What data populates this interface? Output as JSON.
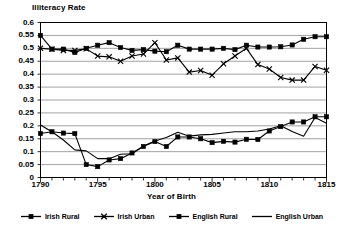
{
  "chart_data": {
    "type": "line",
    "title": "Illiteracy Rate",
    "xlabel": "Year of Birth",
    "ylabel": "",
    "xlim": [
      1790,
      1815
    ],
    "ylim": [
      0,
      0.6
    ],
    "grid": true,
    "legend_position": "bottom",
    "x": [
      1790,
      1791,
      1792,
      1793,
      1794,
      1795,
      1796,
      1797,
      1798,
      1799,
      1800,
      1801,
      1802,
      1803,
      1804,
      1805,
      1806,
      1807,
      1808,
      1809,
      1810,
      1811,
      1812,
      1813,
      1814,
      1815
    ],
    "y_ticks": [
      0,
      0.05,
      0.1,
      0.15,
      0.2,
      0.25,
      0.3,
      0.35,
      0.4,
      0.45,
      0.5,
      0.55,
      0.6
    ],
    "y_tick_labels": [
      "0",
      "0.05",
      "0.1",
      "0.15",
      "0.2",
      "0.25",
      "0.3",
      "0.35",
      "0.4",
      "0.45",
      "0.5",
      "0.55",
      "0.6"
    ],
    "x_ticks": [
      1790,
      1795,
      1800,
      1805,
      1810,
      1815
    ],
    "x_tick_labels": [
      "1790",
      "1795",
      "1800",
      "1805",
      "1810",
      "1815"
    ],
    "series": [
      {
        "name": "Irish Rural",
        "marker": "square",
        "color": "#000000",
        "values": [
          0.55,
          0.497,
          0.497,
          0.484,
          0.5,
          0.512,
          0.522,
          0.503,
          0.492,
          0.495,
          0.489,
          0.487,
          0.512,
          0.497,
          0.497,
          0.497,
          0.5,
          0.495,
          0.512,
          0.505,
          0.505,
          0.506,
          0.513,
          0.535,
          0.545,
          0.545
        ]
      },
      {
        "name": "Irish Urban",
        "marker": "cross",
        "color": "#000000",
        "values": [
          0.5,
          0.497,
          0.492,
          0.492,
          0.498,
          0.47,
          0.467,
          0.45,
          0.47,
          0.478,
          0.522,
          0.455,
          0.463,
          0.408,
          0.414,
          0.396,
          0.44,
          0.47,
          0.5,
          0.437,
          0.42,
          0.387,
          0.377,
          0.377,
          0.43,
          0.415
        ]
      },
      {
        "name": "English Rural",
        "marker": "square",
        "color": "#000000",
        "values": [
          0.17,
          0.177,
          0.172,
          0.17,
          0.05,
          0.042,
          0.068,
          0.073,
          0.095,
          0.12,
          0.139,
          0.12,
          0.157,
          0.157,
          0.15,
          0.135,
          0.14,
          0.137,
          0.148,
          0.147,
          0.18,
          0.197,
          0.215,
          0.215,
          0.235,
          0.235
        ]
      },
      {
        "name": "English Urban",
        "marker": "line",
        "color": "#000000",
        "values": [
          0.203,
          0.177,
          0.145,
          0.107,
          0.103,
          0.073,
          0.073,
          0.09,
          0.092,
          0.122,
          0.141,
          0.155,
          0.175,
          0.16,
          0.165,
          0.167,
          0.172,
          0.177,
          0.177,
          0.18,
          0.188,
          0.2,
          0.178,
          0.16,
          0.232,
          0.21
        ]
      }
    ]
  },
  "legend": {
    "items": [
      {
        "label": "Irish Rural",
        "marker": "square"
      },
      {
        "label": "Irish Urban",
        "marker": "cross"
      },
      {
        "label": "English Rural",
        "marker": "square"
      },
      {
        "label": "English Urban",
        "marker": "line"
      }
    ]
  }
}
